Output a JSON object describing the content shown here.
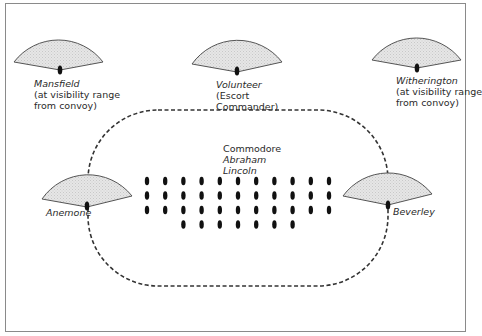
{
  "diagram": {
    "type": "convoy-escort-formation",
    "colors": {
      "sector_fill": "#e2e2e2",
      "sector_stroke": "#555555",
      "ship": "#111111",
      "perimeter": "#333333",
      "frame": "#8a8a8a"
    },
    "escorts": [
      {
        "id": "mansfield",
        "name": "Mansfield",
        "note_lines": [
          "(at visibility range",
          "from convoy)"
        ]
      },
      {
        "id": "volunteer",
        "name": "Volunteer",
        "note_lines": [
          "(Escort",
          "Commander)"
        ]
      },
      {
        "id": "witherington",
        "name": "Witherington",
        "note_lines": [
          "(at visibility range",
          "from convoy)"
        ]
      },
      {
        "id": "anemone",
        "name": "Anemone",
        "note_lines": []
      },
      {
        "id": "beverley",
        "name": "Beverley",
        "note_lines": []
      }
    ],
    "commodore": {
      "title": "Commodore",
      "ship_name_lines": [
        "Abraham",
        "Lincoln"
      ]
    },
    "convoy": {
      "columns": 11,
      "rows_per_column": [
        3,
        3,
        4,
        4,
        4,
        4,
        4,
        4,
        4,
        3,
        3
      ],
      "total_ships": 40
    }
  }
}
